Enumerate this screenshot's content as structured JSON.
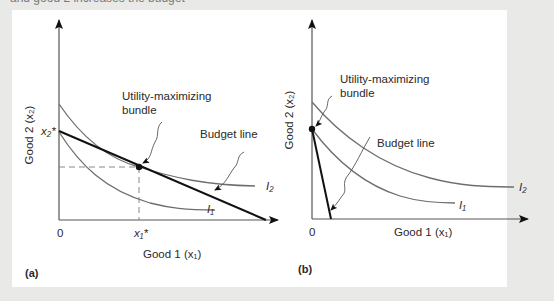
{
  "figure": {
    "clipped_top_text": "and good 2 increases the budget",
    "background_color": "#e9e9e7",
    "panel_color": "#ffffff",
    "curve_color": "#6e6e6e",
    "budget_line_color": "#111111"
  },
  "panel_a": {
    "tag": "(a)",
    "x_axis_label": "Good 1 (x₁)",
    "y_axis_label": "Good 2 (x₂)",
    "origin_label": "0",
    "x_star_label": "x₁*",
    "y_star_label": "x₂*",
    "annotation_bundle_line1": "Utility-maximizing",
    "annotation_bundle_line2": "bundle",
    "annotation_budget": "Budget line",
    "curve_i1_label": "I₁",
    "curve_i2_label": "I₂",
    "solution_type": "interior"
  },
  "panel_b": {
    "tag": "(b)",
    "x_axis_label": "Good 1 (x₁)",
    "y_axis_label": "Good 2 (x₂)",
    "origin_label": "0",
    "annotation_bundle_line1": "Utility-maximizing",
    "annotation_bundle_line2": "bundle",
    "annotation_budget": "Budget line",
    "curve_i1_label": "I₁",
    "curve_i2_label": "I₂",
    "solution_type": "corner"
  }
}
